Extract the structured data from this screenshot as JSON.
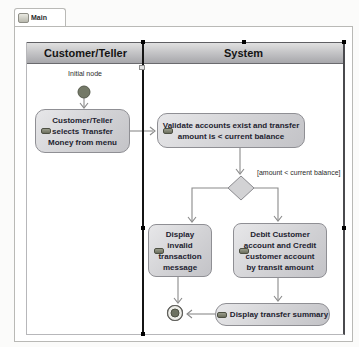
{
  "tab": {
    "label": "Main",
    "icon": "activity-diagram-icon"
  },
  "lanes": {
    "customer": "Customer/Teller",
    "system": "System"
  },
  "labels": {
    "initial_node": "Initial node",
    "guard": "[amount < current balance]"
  },
  "nodes": {
    "select": {
      "lines": [
        "Customer/Teller",
        "selects Transfer",
        "Money from menu"
      ]
    },
    "validate": {
      "lines": [
        "Validate accounts exist and transfer",
        "amount is < current balance"
      ]
    },
    "invalid": {
      "lines": [
        "Display",
        "invalid",
        "transaction",
        "message"
      ]
    },
    "debit": {
      "lines": [
        "Debit Customer",
        "account and Credit",
        "customer account",
        "by transit amount"
      ]
    },
    "summary": {
      "label": "Display transfer summary"
    }
  },
  "colors": {
    "lane_header_top": "#e0e0e0",
    "lane_header_bottom": "#a7a7ab",
    "node_fill_top": "#e7e7e9",
    "node_fill_bottom": "#c3c3c7",
    "node_border": "#8f8f94",
    "edge": "#8a8a8a",
    "divider": "#141414",
    "initial_node_fill": "#747967",
    "final_node_fill": "#6d7261"
  }
}
